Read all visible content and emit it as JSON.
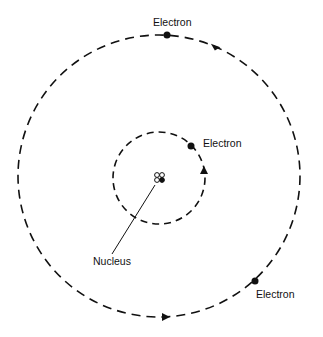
{
  "diagram": {
    "labels": {
      "electron_top": "Electron",
      "electron_inner": "Electron",
      "electron_bottom": "Electron",
      "nucleus": "Nucleus"
    },
    "colors": {
      "stroke": "#111111",
      "background": "#ffffff"
    },
    "orbits": [
      {
        "name": "inner-orbit",
        "style": "dashed"
      },
      {
        "name": "outer-orbit",
        "style": "dashed"
      }
    ]
  }
}
